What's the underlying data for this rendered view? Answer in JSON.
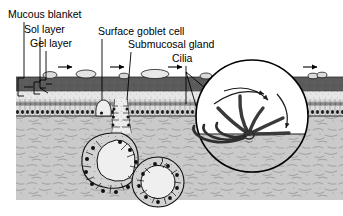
{
  "figure": {
    "type": "anatomical-diagram",
    "width": 343,
    "height": 216
  },
  "labels": [
    {
      "id": "mucous-blanket",
      "text": "Mucous blanket",
      "x": 8,
      "y": 18
    },
    {
      "id": "sol-layer",
      "text": "Sol layer",
      "x": 24,
      "y": 33
    },
    {
      "id": "gel-layer",
      "text": "Gel layer",
      "x": 30,
      "y": 47
    },
    {
      "id": "surface-goblet",
      "text": "Surface goblet cell",
      "x": 98,
      "y": 35
    },
    {
      "id": "submucosal",
      "text": "Submucosal gland",
      "x": 128,
      "y": 48
    },
    {
      "id": "cilia",
      "text": "Cilia",
      "x": 172,
      "y": 62
    }
  ],
  "layers": {
    "gel": {
      "name": "Gel layer",
      "color": "#5b5b5b",
      "y": 77,
      "height": 14
    },
    "sol": {
      "name": "Sol layer",
      "color": "#e2e2e2",
      "y": 91,
      "height": 8
    },
    "epithelium": {
      "name": "Ciliated epithelium",
      "color": "#d8d8d8",
      "y": 99,
      "height": 17
    },
    "submucosa": {
      "name": "Submucosa",
      "color": "#c9c9c9",
      "y": 116,
      "height": 84
    }
  },
  "flow_arrows": {
    "name": "mucus-transport-direction",
    "count": 4,
    "direction": "right",
    "y": 68,
    "x_positions": [
      62,
      112,
      168,
      300
    ]
  },
  "mucus_particles": {
    "name": "trapped-particles",
    "count": 6,
    "x_positions": [
      50,
      86,
      124,
      152,
      205,
      315
    ],
    "y": 76
  },
  "inset": {
    "name": "ciliary-beat-cycle-magnification",
    "cx": 252,
    "cy": 116,
    "r": 56,
    "fill_top": "#ffffff",
    "fill_bottom": "#c9c9c9",
    "waterline_y": 134,
    "description": "Magnified view of a cilium through its beat cycle: recovery stroke (bent, leftward) and effective stroke (straight, rightward), with curved motion arrows.",
    "cilia_phases": 6,
    "motion_arrows": 3
  },
  "gland": {
    "name": "submucosal-gland",
    "duct_x": 120,
    "acini": [
      {
        "cx": 104,
        "cy": 168,
        "rx": 30,
        "ry": 28
      },
      {
        "cx": 158,
        "cy": 182,
        "rx": 26,
        "ry": 25
      }
    ]
  },
  "goblet_cell": {
    "name": "surface-goblet-cell",
    "x": 100,
    "y": 104
  },
  "colors": {
    "ink": "#000000",
    "gel": "#5b5b5b",
    "sol": "#e2e2e2",
    "epithelium": "#d8d8d8",
    "submucosa": "#c9c9c9",
    "background": "#ffffff"
  }
}
